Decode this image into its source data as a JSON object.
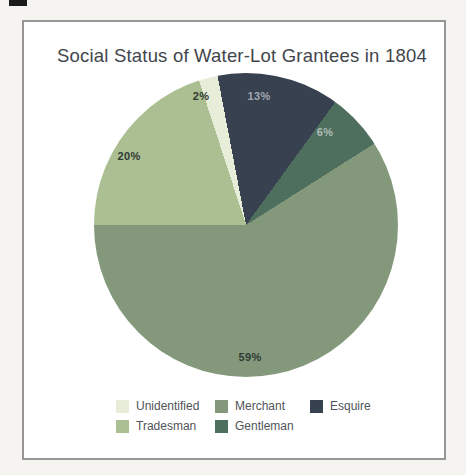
{
  "title": "Social Status of Water-Lot Grantees in 1804",
  "chart_data": {
    "type": "pie",
    "title": "Social Status of Water-Lot Grantees in 1804",
    "categories": [
      "Unidentified",
      "Tradesman",
      "Merchant",
      "Gentleman",
      "Esquire"
    ],
    "values": [
      2,
      20,
      59,
      6,
      13
    ],
    "unit": "%",
    "colors": [
      "#e8edda",
      "#abbf92",
      "#84997c",
      "#4e6e5e",
      "#374150"
    ],
    "conic_start_deg": -18,
    "clockwise_render_order": [
      0,
      4,
      3,
      2,
      1
    ],
    "legend_position": "bottom",
    "slice_labels": [
      {
        "text": "2%",
        "x": 201,
        "y": 96,
        "tone": "dark"
      },
      {
        "text": "20%",
        "x": 129,
        "y": 156,
        "tone": "dark"
      },
      {
        "text": "59%",
        "x": 250,
        "y": 357,
        "tone": "dark"
      },
      {
        "text": "6%",
        "x": 325,
        "y": 132,
        "tone": "light"
      },
      {
        "text": "13%",
        "x": 259,
        "y": 96,
        "tone": "light"
      }
    ]
  },
  "legend": {
    "items": [
      {
        "label": "Unidentified",
        "color": "#e8edda"
      },
      {
        "label": "Tradesman",
        "color": "#abbf92"
      },
      {
        "label": "Merchant",
        "color": "#84997c"
      },
      {
        "label": "Gentleman",
        "color": "#4e6e5e"
      },
      {
        "label": "Esquire",
        "color": "#374150"
      }
    ]
  }
}
